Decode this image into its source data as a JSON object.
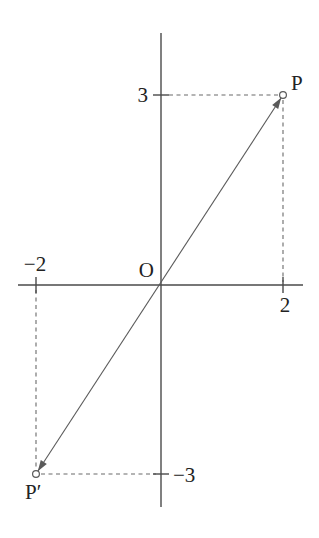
{
  "diagram": {
    "width": 319,
    "height": 538,
    "colors": {
      "background": "#ffffff",
      "axis": "#4a4a4a",
      "segment": "#5a5a5a",
      "guide": "#6a6a6a",
      "text": "#222222"
    },
    "points": {
      "P": {
        "math_x": 2,
        "math_y": 3,
        "px": [
          283,
          95
        ],
        "label": "P"
      },
      "P_prime": {
        "math_x": -2,
        "math_y": -3,
        "px": [
          36,
          474
        ],
        "label": "P′"
      }
    },
    "origin": {
      "label": "O",
      "px": [
        161,
        285
      ]
    },
    "axes": {
      "x_axis": {
        "y": 285,
        "x1": 18,
        "x2": 303
      },
      "y_axis": {
        "x": 161,
        "y1": 33,
        "y2": 507
      }
    },
    "ticks": [
      {
        "id": "tick-3",
        "axis": "y",
        "value": "3",
        "px": [
          161,
          95
        ]
      },
      {
        "id": "tick-neg3",
        "axis": "y",
        "value": "−3",
        "px": [
          161,
          474
        ]
      },
      {
        "id": "tick-neg2",
        "axis": "x",
        "value": "−2",
        "px": [
          36,
          285
        ]
      },
      {
        "id": "tick-2",
        "axis": "x",
        "value": "2",
        "px": [
          283,
          285
        ]
      }
    ],
    "tick_half_length": 8,
    "labels": [
      {
        "id": "label-3",
        "text": "3",
        "px": [
          148,
          102
        ],
        "anchor": "end"
      },
      {
        "id": "label-neg3",
        "text": "−3",
        "px": [
          173,
          482
        ],
        "anchor": "start"
      },
      {
        "id": "label-neg2",
        "text": "−2",
        "px": [
          35,
          271
        ],
        "anchor": "middle"
      },
      {
        "id": "label-2",
        "text": "2",
        "px": [
          285,
          312
        ],
        "anchor": "middle"
      },
      {
        "id": "label-O",
        "text": "O",
        "px": [
          154,
          277
        ],
        "anchor": "end"
      },
      {
        "id": "label-P",
        "text": "P",
        "px": [
          291,
          90
        ],
        "anchor": "start"
      },
      {
        "id": "label-P-prime",
        "text": "P′",
        "px": [
          25,
          499
        ],
        "anchor": "start"
      }
    ],
    "segment": {
      "from_px": [
        37.8,
        471.2
      ],
      "to_px": [
        281.2,
        97.8
      ],
      "arrow_both_ends": true,
      "arrow_length": 11,
      "arrow_half_width": 3.6
    },
    "guides": [
      {
        "id": "guide-ytick3-to-P",
        "from": [
          169,
          95
        ],
        "to": [
          278,
          95
        ]
      },
      {
        "id": "guide-P-to-xaxis",
        "from": [
          283,
          100
        ],
        "to": [
          283,
          282
        ]
      },
      {
        "id": "guide-xtickneg2-to-Pprime",
        "from": [
          36,
          290
        ],
        "to": [
          36,
          469
        ]
      },
      {
        "id": "guide-Pprime-to-yaxis",
        "from": [
          41,
          474
        ],
        "to": [
          156,
          474
        ]
      }
    ],
    "marker_radius": 3.4,
    "dash_pattern": "4 3.5"
  }
}
